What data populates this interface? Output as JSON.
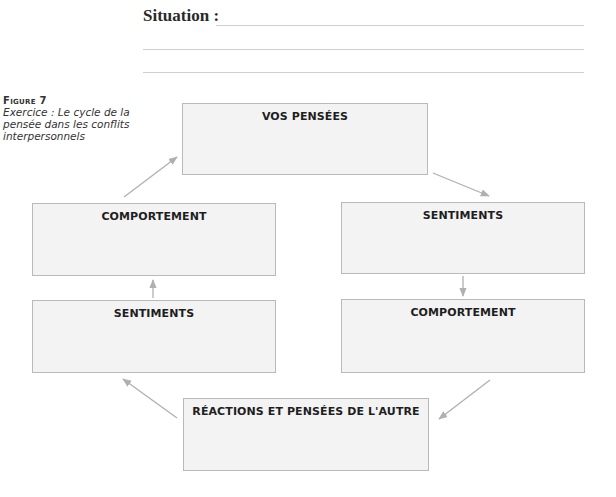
{
  "situation": {
    "label": "Situation :",
    "lines": 3
  },
  "figure": {
    "number": "Figure 7",
    "caption": "Exercice : Le cycle de la pensée dans les conflits interpersonnels"
  },
  "cycle": {
    "top": "VOS PENSÉES",
    "right_upper": "SENTIMENTS",
    "right_lower": "COMPORTEMENT",
    "bottom": "RÉACTIONS ET PENSÉES DE L'AUTRE",
    "left_lower": "SENTIMENTS",
    "left_upper": "COMPORTEMENT"
  },
  "colors": {
    "box_fill": "#f3f3f3",
    "box_border": "#b9b9b9",
    "arrow": "#b0b0b0",
    "rule": "#cfcfcf"
  }
}
